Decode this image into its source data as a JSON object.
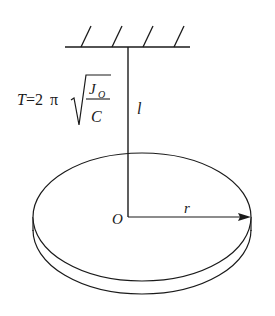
{
  "diagram": {
    "formula": {
      "lhs": "T",
      "equals": "=2",
      "pi": "π",
      "numerator": "J",
      "numerator_subscript": "O",
      "denominator": "C"
    },
    "labels": {
      "rod_length": "l",
      "center": "O",
      "radius": "r"
    },
    "colors": {
      "stroke": "#1a1a1a",
      "background": "#ffffff"
    }
  }
}
